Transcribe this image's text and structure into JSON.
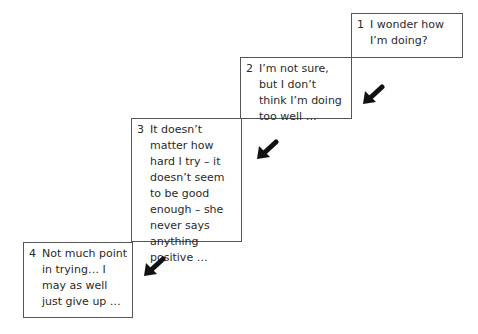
{
  "diagram": {
    "type": "staircase",
    "steps": [
      {
        "number": "1",
        "text": "I wonder how I’m doing?"
      },
      {
        "number": "2",
        "text": "I’m not sure, but I don’t think I’m doing too well …"
      },
      {
        "number": "3",
        "text": "It doesn’t matter how hard I try – it doesn’t seem to be good enough – she never says anything positive …"
      },
      {
        "number": "4",
        "text": "Not much point in trying… I may as well just give up …"
      }
    ],
    "arrows": [
      {
        "icon": "arrow-down-left-icon",
        "from": "1",
        "to": "2"
      },
      {
        "icon": "arrow-down-left-icon",
        "from": "2",
        "to": "3"
      },
      {
        "icon": "arrow-down-left-icon",
        "from": "3",
        "to": "4"
      }
    ]
  }
}
